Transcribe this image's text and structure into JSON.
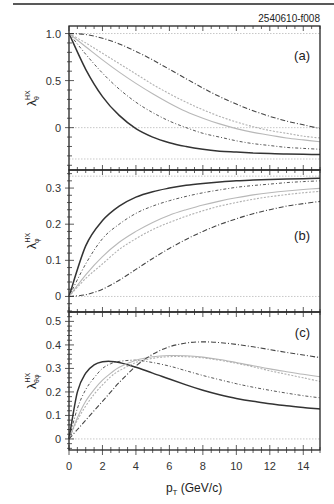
{
  "figure": {
    "id_label": "2540610-f008",
    "xlabel_main": "p",
    "xlabel_sub": "T",
    "xlabel_units": " (GeV/c)"
  },
  "chart_data": [
    {
      "type": "line",
      "panel": "(a)",
      "ylabel_main": "λ",
      "ylabel_sub": "θ",
      "ylabel_sup": "HX",
      "xlim": [
        0,
        15
      ],
      "ylim": [
        -0.45,
        1.08
      ],
      "xticks": [
        0,
        2,
        4,
        6,
        8,
        10,
        12,
        14
      ],
      "yticks": [
        1.0,
        0.5,
        0
      ],
      "ytick_labels": [
        "1.0",
        "0.5",
        "0"
      ],
      "reference_lines": [
        1.0,
        0,
        -0.333
      ],
      "x": [
        0,
        1,
        2,
        3,
        4,
        5,
        6,
        7,
        8,
        9,
        10,
        11,
        12,
        13,
        14,
        15
      ],
      "series": [
        {
          "name": "solid",
          "style": "solid-dark",
          "values": [
            1.0,
            0.62,
            0.33,
            0.13,
            -0.01,
            -0.1,
            -0.16,
            -0.2,
            -0.23,
            -0.25,
            -0.26,
            -0.27,
            -0.275,
            -0.28,
            -0.283,
            -0.285
          ]
        },
        {
          "name": "dot-dash-short",
          "style": "dotdash-fine",
          "values": [
            1.0,
            0.78,
            0.58,
            0.41,
            0.27,
            0.16,
            0.07,
            0.0,
            -0.06,
            -0.1,
            -0.14,
            -0.17,
            -0.19,
            -0.21,
            -0.22,
            -0.23
          ]
        },
        {
          "name": "light-1",
          "style": "light-solid",
          "values": [
            1.0,
            0.86,
            0.72,
            0.59,
            0.47,
            0.36,
            0.26,
            0.17,
            0.1,
            0.04,
            -0.01,
            -0.05,
            -0.08,
            -0.11,
            -0.13,
            -0.15
          ]
        },
        {
          "name": "light-2",
          "style": "light-dotted",
          "values": [
            1.0,
            0.9,
            0.79,
            0.68,
            0.57,
            0.46,
            0.36,
            0.27,
            0.19,
            0.12,
            0.06,
            0.01,
            -0.03,
            -0.06,
            -0.09,
            -0.11
          ]
        },
        {
          "name": "dash-dot",
          "style": "dashdot-dark",
          "values": [
            1.0,
            0.99,
            0.95,
            0.89,
            0.81,
            0.72,
            0.62,
            0.52,
            0.42,
            0.33,
            0.25,
            0.18,
            0.12,
            0.07,
            0.03,
            -0.01
          ]
        }
      ]
    },
    {
      "type": "line",
      "panel": "(b)",
      "ylabel_main": "λ",
      "ylabel_sub": "φ",
      "ylabel_sup": "HX",
      "xlim": [
        0,
        15
      ],
      "ylim": [
        -0.043,
        0.35
      ],
      "xticks": [
        0,
        2,
        4,
        6,
        8,
        10,
        12,
        14
      ],
      "yticks": [
        0.3,
        0.2,
        0.1,
        0
      ],
      "ytick_labels": [
        "0.3",
        "0.2",
        "0.1",
        "0"
      ],
      "reference_lines": [
        0.333,
        0
      ],
      "x": [
        0,
        1,
        2,
        3,
        4,
        5,
        6,
        7,
        8,
        9,
        10,
        11,
        12,
        13,
        14,
        15
      ],
      "series": [
        {
          "name": "solid",
          "style": "solid-dark",
          "values": [
            0.0,
            0.14,
            0.21,
            0.25,
            0.275,
            0.29,
            0.3,
            0.308,
            0.313,
            0.317,
            0.32,
            0.322,
            0.324,
            0.325,
            0.326,
            0.327
          ]
        },
        {
          "name": "dot-dash-short",
          "style": "dotdash-fine",
          "values": [
            0.0,
            0.09,
            0.16,
            0.2,
            0.23,
            0.25,
            0.265,
            0.277,
            0.287,
            0.295,
            0.302,
            0.307,
            0.311,
            0.315,
            0.318,
            0.32
          ]
        },
        {
          "name": "light-1",
          "style": "light-solid",
          "values": [
            0.0,
            0.06,
            0.11,
            0.15,
            0.18,
            0.205,
            0.225,
            0.24,
            0.253,
            0.264,
            0.273,
            0.281,
            0.287,
            0.292,
            0.296,
            0.299
          ]
        },
        {
          "name": "light-2",
          "style": "light-dotted",
          "values": [
            0.0,
            0.05,
            0.09,
            0.13,
            0.16,
            0.185,
            0.205,
            0.222,
            0.237,
            0.25,
            0.26,
            0.269,
            0.276,
            0.282,
            0.287,
            0.291
          ]
        },
        {
          "name": "dash-dot",
          "style": "dashdot-dark",
          "values": [
            0.0,
            0.005,
            0.02,
            0.045,
            0.075,
            0.105,
            0.133,
            0.158,
            0.18,
            0.199,
            0.215,
            0.229,
            0.24,
            0.25,
            0.257,
            0.263
          ]
        }
      ]
    },
    {
      "type": "line",
      "panel": "(c)",
      "ylabel_main": "λ",
      "ylabel_sub": "θφ",
      "ylabel_sup": "HX",
      "xlim": [
        0,
        15
      ],
      "ylim": [
        -0.047,
        0.54
      ],
      "xticks": [
        0,
        2,
        4,
        6,
        8,
        10,
        12,
        14
      ],
      "xtick_labels": [
        "0",
        "2",
        "4",
        "6",
        "8",
        "10",
        "12",
        "14"
      ],
      "yticks": [
        0.5,
        0.4,
        0.3,
        0.2,
        0.1,
        0
      ],
      "ytick_labels": [
        "0.5",
        "0.4",
        "0.3",
        "0.2",
        "0.1",
        "0"
      ],
      "reference_lines": [
        0
      ],
      "x": [
        0,
        0.5,
        1,
        1.5,
        2,
        2.5,
        3,
        4,
        5,
        6,
        7,
        8,
        9,
        10,
        11,
        12,
        13,
        14,
        15
      ],
      "series": [
        {
          "name": "solid",
          "style": "solid-dark",
          "values": [
            0.0,
            0.2,
            0.28,
            0.315,
            0.328,
            0.33,
            0.325,
            0.305,
            0.28,
            0.255,
            0.23,
            0.207,
            0.188,
            0.172,
            0.16,
            0.15,
            0.141,
            0.134,
            0.128
          ]
        },
        {
          "name": "dot-dash-short",
          "style": "dotdash-fine",
          "values": [
            0.0,
            0.13,
            0.21,
            0.26,
            0.3,
            0.32,
            0.33,
            0.335,
            0.325,
            0.31,
            0.29,
            0.27,
            0.252,
            0.235,
            0.22,
            0.207,
            0.195,
            0.184,
            0.175
          ]
        },
        {
          "name": "light-1",
          "style": "light-solid",
          "values": [
            0.0,
            0.09,
            0.16,
            0.21,
            0.25,
            0.28,
            0.305,
            0.335,
            0.35,
            0.355,
            0.354,
            0.348,
            0.338,
            0.325,
            0.311,
            0.298,
            0.286,
            0.275,
            0.265
          ]
        },
        {
          "name": "light-2",
          "style": "light-dotted",
          "values": [
            0.0,
            0.08,
            0.14,
            0.19,
            0.23,
            0.265,
            0.29,
            0.325,
            0.343,
            0.35,
            0.35,
            0.345,
            0.335,
            0.322,
            0.307,
            0.29,
            0.275,
            0.26,
            0.245
          ]
        },
        {
          "name": "dash-dot",
          "style": "dashdot-dark",
          "values": [
            0.0,
            0.04,
            0.08,
            0.12,
            0.16,
            0.2,
            0.24,
            0.31,
            0.36,
            0.392,
            0.408,
            0.413,
            0.41,
            0.402,
            0.392,
            0.38,
            0.368,
            0.357,
            0.346
          ]
        }
      ]
    }
  ],
  "layout": {
    "plot_left": 69,
    "plot_right": 320,
    "panels_px": [
      {
        "top": 26,
        "bottom": 170
      },
      {
        "top": 170,
        "bottom": 312
      },
      {
        "top": 312,
        "bottom": 450
      }
    ]
  }
}
